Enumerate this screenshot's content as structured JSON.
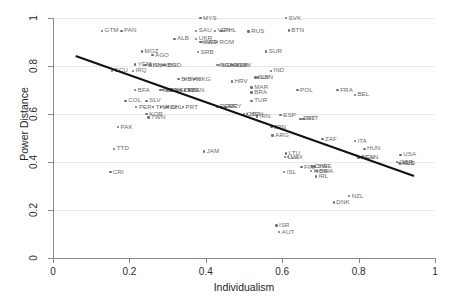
{
  "chart_data": {
    "type": "scatter",
    "title": "",
    "xlabel": "Individualism",
    "ylabel": "Power Distance",
    "xlim": [
      0,
      1
    ],
    "ylim": [
      0,
      1
    ],
    "xticks": [
      0,
      0.2,
      0.4,
      0.6,
      0.8,
      1
    ],
    "xtick_labels": [
      "0",
      "0.2",
      "0.4",
      "0.6",
      "0.8",
      "1"
    ],
    "yticks": [
      0,
      0.2,
      0.4,
      0.6,
      0.8,
      1
    ],
    "ytick_labels": [
      "0",
      "0.2",
      "0.4",
      "0.6",
      "0.8",
      "1"
    ],
    "grid": "horizontal",
    "legend": "none",
    "fit_line": {
      "label": "linear-fit",
      "x_start": 0.06,
      "y_start": 0.845,
      "x_end": 0.945,
      "y_end": 0.345,
      "color": "#111111"
    },
    "points": [
      {
        "code": "MYS",
        "x": 0.386,
        "y": 1.0
      },
      {
        "code": "SVK",
        "x": 0.61,
        "y": 1.0
      },
      {
        "code": "BTN",
        "x": 0.617,
        "y": 0.948
      },
      {
        "code": "GTM",
        "x": 0.128,
        "y": 0.947
      },
      {
        "code": "PAN",
        "x": 0.179,
        "y": 0.947
      },
      {
        "code": "SAU",
        "x": 0.375,
        "y": 0.947
      },
      {
        "code": "PHL",
        "x": 0.441,
        "y": 0.947
      },
      {
        "code": "VEN",
        "x": 0.424,
        "y": 0.947
      },
      {
        "code": "RUS",
        "x": 0.512,
        "y": 0.944
      },
      {
        "code": "ALB",
        "x": 0.318,
        "y": 0.913
      },
      {
        "code": "UKR",
        "x": 0.375,
        "y": 0.913
      },
      {
        "code": "KWT",
        "x": 0.386,
        "y": 0.9
      },
      {
        "code": "ARE",
        "x": 0.389,
        "y": 0.9
      },
      {
        "code": "ROM",
        "x": 0.429,
        "y": 0.9
      },
      {
        "code": "MOZ",
        "x": 0.233,
        "y": 0.861
      },
      {
        "code": "AGO",
        "x": 0.26,
        "y": 0.845
      },
      {
        "code": "SRB",
        "x": 0.38,
        "y": 0.858
      },
      {
        "code": "SUR",
        "x": 0.558,
        "y": 0.861
      },
      {
        "code": "YEM",
        "x": 0.215,
        "y": 0.806
      },
      {
        "code": "CHN",
        "x": 0.242,
        "y": 0.803
      },
      {
        "code": "GHA",
        "x": 0.255,
        "y": 0.803
      },
      {
        "code": "BGD",
        "x": 0.293,
        "y": 0.803
      },
      {
        "code": "IDN",
        "x": 0.289,
        "y": 0.803
      },
      {
        "code": "NGA",
        "x": 0.43,
        "y": 0.803
      },
      {
        "code": "MEX",
        "x": 0.434,
        "y": 0.803
      },
      {
        "code": "EGY",
        "x": 0.466,
        "y": 0.803
      },
      {
        "code": "BWA",
        "x": 0.47,
        "y": 0.803
      },
      {
        "code": "LBY",
        "x": 0.482,
        "y": 0.803
      },
      {
        "code": "ECU",
        "x": 0.155,
        "y": 0.78
      },
      {
        "code": "IRQ",
        "x": 0.209,
        "y": 0.78
      },
      {
        "code": "IND",
        "x": 0.57,
        "y": 0.78
      },
      {
        "code": "SLV",
        "x": 0.53,
        "y": 0.752
      },
      {
        "code": "LBN",
        "x": 0.537,
        "y": 0.752
      },
      {
        "code": "BIH",
        "x": 0.329,
        "y": 0.745
      },
      {
        "code": "SVN",
        "x": 0.345,
        "y": 0.745
      },
      {
        "code": "HKG",
        "x": 0.37,
        "y": 0.745
      },
      {
        "code": "HRV",
        "x": 0.468,
        "y": 0.735
      },
      {
        "code": "MAR",
        "x": 0.52,
        "y": 0.71
      },
      {
        "code": "BFA",
        "x": 0.215,
        "y": 0.7
      },
      {
        "code": "MLI",
        "x": 0.281,
        "y": 0.7
      },
      {
        "code": "SEN",
        "x": 0.288,
        "y": 0.7
      },
      {
        "code": "ETH",
        "x": 0.298,
        "y": 0.7
      },
      {
        "code": "SLE",
        "x": 0.324,
        "y": 0.7
      },
      {
        "code": "ZMB",
        "x": 0.334,
        "y": 0.7
      },
      {
        "code": "TZA",
        "x": 0.345,
        "y": 0.7
      },
      {
        "code": "KEN",
        "x": 0.356,
        "y": 0.7
      },
      {
        "code": "BRA",
        "x": 0.52,
        "y": 0.69
      },
      {
        "code": "POL",
        "x": 0.64,
        "y": 0.7
      },
      {
        "code": "FRA",
        "x": 0.745,
        "y": 0.7
      },
      {
        "code": "BEL",
        "x": 0.79,
        "y": 0.68
      },
      {
        "code": "COL",
        "x": 0.19,
        "y": 0.655
      },
      {
        "code": "SLV2",
        "x": 0.245,
        "y": 0.655
      },
      {
        "code": "TUR",
        "x": 0.52,
        "y": 0.655
      },
      {
        "code": "PER",
        "x": 0.218,
        "y": 0.628
      },
      {
        "code": "THA",
        "x": 0.262,
        "y": 0.628
      },
      {
        "code": "VNM",
        "x": 0.282,
        "y": 0.628
      },
      {
        "code": "CHL",
        "x": 0.3,
        "y": 0.628
      },
      {
        "code": "PRT",
        "x": 0.34,
        "y": 0.628
      },
      {
        "code": "ROU",
        "x": 0.43,
        "y": 0.63
      },
      {
        "code": "GRC",
        "x": 0.44,
        "y": 0.63
      },
      {
        "code": "URY",
        "x": 0.452,
        "y": 0.63
      },
      {
        "code": "KOR",
        "x": 0.245,
        "y": 0.6
      },
      {
        "code": "TWN",
        "x": 0.25,
        "y": 0.585
      },
      {
        "code": "CZE",
        "x": 0.5,
        "y": 0.6
      },
      {
        "code": "HUN2",
        "x": 0.508,
        "y": 0.6
      },
      {
        "code": "IRN",
        "x": 0.534,
        "y": 0.59
      },
      {
        "code": "ESP",
        "x": 0.596,
        "y": 0.596
      },
      {
        "code": "JPN",
        "x": 0.572,
        "y": 0.545
      },
      {
        "code": "MLT",
        "x": 0.656,
        "y": 0.58
      },
      {
        "code": "EST",
        "x": 0.648,
        "y": 0.58
      },
      {
        "code": "PAK",
        "x": 0.17,
        "y": 0.545
      },
      {
        "code": "ARG",
        "x": 0.575,
        "y": 0.51
      },
      {
        "code": "TTD",
        "x": 0.16,
        "y": 0.455
      },
      {
        "code": "JAM",
        "x": 0.395,
        "y": 0.443
      },
      {
        "code": "ZAF",
        "x": 0.705,
        "y": 0.495
      },
      {
        "code": "ITA",
        "x": 0.79,
        "y": 0.487
      },
      {
        "code": "HUN",
        "x": 0.815,
        "y": 0.455
      },
      {
        "code": "LTU",
        "x": 0.61,
        "y": 0.435
      },
      {
        "code": "LVA",
        "x": 0.608,
        "y": 0.42
      },
      {
        "code": "LUX",
        "x": 0.615,
        "y": 0.42
      },
      {
        "code": "DEU",
        "x": 0.8,
        "y": 0.418
      },
      {
        "code": "CAN",
        "x": 0.81,
        "y": 0.418
      },
      {
        "code": "USA",
        "x": 0.91,
        "y": 0.43
      },
      {
        "code": "GBR",
        "x": 0.9,
        "y": 0.4
      },
      {
        "code": "AUS",
        "x": 0.905,
        "y": 0.395
      },
      {
        "code": "NLD",
        "x": 0.908,
        "y": 0.393
      },
      {
        "code": "FIN",
        "x": 0.65,
        "y": 0.378
      },
      {
        "code": "CHE",
        "x": 0.678,
        "y": 0.382
      },
      {
        "code": "SWE",
        "x": 0.685,
        "y": 0.382
      },
      {
        "code": "NOR",
        "x": 0.676,
        "y": 0.362
      },
      {
        "code": "BWA2",
        "x": 0.69,
        "y": 0.362
      },
      {
        "code": "ISL",
        "x": 0.605,
        "y": 0.358
      },
      {
        "code": "IRL",
        "x": 0.688,
        "y": 0.34
      },
      {
        "code": "CRI",
        "x": 0.15,
        "y": 0.358
      },
      {
        "code": "NZL",
        "x": 0.775,
        "y": 0.258
      },
      {
        "code": "DNK",
        "x": 0.735,
        "y": 0.232
      },
      {
        "code": "ISR",
        "x": 0.585,
        "y": 0.135
      },
      {
        "code": "AUT",
        "x": 0.592,
        "y": 0.108
      }
    ]
  },
  "style": {
    "point_color": "#6f6f6f",
    "label_color": "#6a6a6a",
    "grid_color": "#e8e8e8",
    "axis_color": "#8a8a8a",
    "fit_color": "#111111",
    "background": "#ffffff"
  }
}
